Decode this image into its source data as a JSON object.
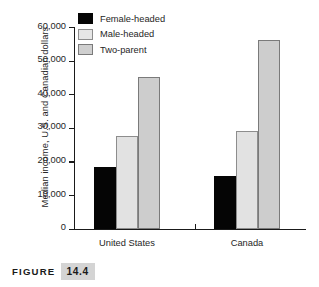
{
  "caption": {
    "word": "FIGURE",
    "number": "14.4"
  },
  "chart_data": {
    "type": "bar",
    "title": "",
    "xlabel": "",
    "ylabel": "Median income, U.S. and Canadian dollars",
    "categories": [
      "United States",
      "Canada"
    ],
    "series": [
      {
        "name": "Female-headed",
        "color": "#050505",
        "values": [
          18400,
          15800
        ]
      },
      {
        "name": "Male-headed",
        "color": "#e2e2e2",
        "values": [
          27600,
          29000
        ]
      },
      {
        "name": "Two-parent",
        "color": "#cdcdcd",
        "values": [
          45000,
          56000
        ]
      }
    ],
    "ylim": [
      0,
      60000
    ],
    "yticks": [
      0,
      10000,
      20000,
      30000,
      40000,
      50000,
      60000
    ],
    "ytick_labels": [
      "0",
      "10,000",
      "20,000",
      "30,000",
      "40,000",
      "50,000",
      "60,000"
    ],
    "grid": false,
    "legend_position": "top-left"
  },
  "axis": {
    "ticks": [
      {
        "label": "60,000",
        "value": 60000
      },
      {
        "label": "50,000",
        "value": 50000
      },
      {
        "label": "40,000",
        "value": 40000
      },
      {
        "label": "30,000",
        "value": 30000
      },
      {
        "label": "20,000",
        "value": 20000
      },
      {
        "label": "10,000",
        "value": 10000
      },
      {
        "label": "0",
        "value": 0
      }
    ]
  },
  "legend": {
    "items": [
      {
        "label": "Female-headed",
        "swatch": "black"
      },
      {
        "label": "Male-headed",
        "swatch": "light"
      },
      {
        "label": "Two-parent",
        "swatch": "mid"
      }
    ]
  },
  "categories": [
    {
      "label": "United States"
    },
    {
      "label": "Canada"
    }
  ]
}
